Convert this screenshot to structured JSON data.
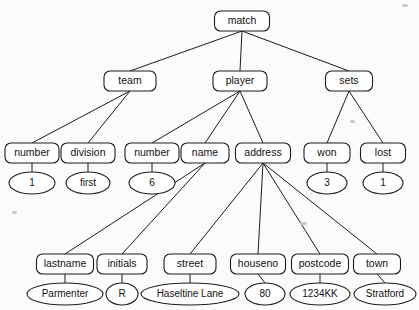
{
  "diagram": {
    "type": "tree",
    "background_color": "#fbfbfa",
    "line_color": "#1c1c1c",
    "node_fill": "#ffffff",
    "element_nodes": [
      {
        "id": "match",
        "label": "match",
        "x": 242,
        "y": 21,
        "w": 55,
        "h": 20,
        "level": 0
      },
      {
        "id": "team",
        "label": "team",
        "x": 130,
        "y": 81,
        "w": 52,
        "h": 20,
        "level": 1
      },
      {
        "id": "player",
        "label": "player",
        "x": 240,
        "y": 81,
        "w": 54,
        "h": 20,
        "level": 1
      },
      {
        "id": "sets",
        "label": "sets",
        "x": 349,
        "y": 81,
        "w": 47,
        "h": 20,
        "level": 1
      },
      {
        "id": "t_number",
        "label": "number",
        "x": 32,
        "y": 153,
        "w": 54,
        "h": 20,
        "level": 2
      },
      {
        "id": "division",
        "label": "division",
        "x": 88,
        "y": 153,
        "w": 54,
        "h": 20,
        "level": 2
      },
      {
        "id": "p_number",
        "label": "number",
        "x": 152,
        "y": 153,
        "w": 54,
        "h": 20,
        "level": 2
      },
      {
        "id": "name",
        "label": "name",
        "x": 205,
        "y": 153,
        "w": 48,
        "h": 20,
        "level": 2
      },
      {
        "id": "address",
        "label": "address",
        "x": 263,
        "y": 153,
        "w": 55,
        "h": 20,
        "level": 2
      },
      {
        "id": "won",
        "label": "won",
        "x": 327,
        "y": 153,
        "w": 46,
        "h": 20,
        "level": 2
      },
      {
        "id": "lost",
        "label": "lost",
        "x": 383,
        "y": 153,
        "w": 45,
        "h": 20,
        "level": 2
      },
      {
        "id": "lastname",
        "label": "lastname",
        "x": 65,
        "y": 264,
        "w": 57,
        "h": 20,
        "level": 3
      },
      {
        "id": "initials",
        "label": "initials",
        "x": 122,
        "y": 264,
        "w": 50,
        "h": 20,
        "level": 3
      },
      {
        "id": "street",
        "label": "street",
        "x": 190,
        "y": 264,
        "w": 52,
        "h": 20,
        "level": 3
      },
      {
        "id": "houseno",
        "label": "houseno",
        "x": 258,
        "y": 264,
        "w": 55,
        "h": 20,
        "level": 3
      },
      {
        "id": "postcode",
        "label": "postcode",
        "x": 320,
        "y": 264,
        "w": 57,
        "h": 20,
        "level": 3
      },
      {
        "id": "town",
        "label": "town",
        "x": 377,
        "y": 264,
        "w": 47,
        "h": 20,
        "level": 3
      }
    ],
    "value_nodes": [
      {
        "id": "v_team_number",
        "label": "1",
        "x": 32,
        "y": 183,
        "rx": 23,
        "ry": 11,
        "parent": "t_number"
      },
      {
        "id": "v_division",
        "label": "first",
        "x": 88,
        "y": 183,
        "rx": 22,
        "ry": 11,
        "parent": "division"
      },
      {
        "id": "v_p_number",
        "label": "6",
        "x": 152,
        "y": 183,
        "rx": 23,
        "ry": 11,
        "parent": "p_number"
      },
      {
        "id": "v_won",
        "label": "3",
        "x": 327,
        "y": 183,
        "rx": 20,
        "ry": 11,
        "parent": "won"
      },
      {
        "id": "v_lost",
        "label": "1",
        "x": 383,
        "y": 183,
        "rx": 20,
        "ry": 11,
        "parent": "lost"
      },
      {
        "id": "v_lastname",
        "label": "Parmenter",
        "x": 65,
        "y": 294,
        "rx": 38,
        "ry": 11,
        "parent": "lastname"
      },
      {
        "id": "v_initials",
        "label": "R",
        "x": 122,
        "y": 294,
        "rx": 16,
        "ry": 11,
        "parent": "initials"
      },
      {
        "id": "v_street",
        "label": "Haseltine Lane",
        "x": 190,
        "y": 294,
        "rx": 49,
        "ry": 11,
        "parent": "street"
      },
      {
        "id": "v_houseno",
        "label": "80",
        "x": 265,
        "y": 294,
        "rx": 20,
        "ry": 11,
        "parent": "houseno"
      },
      {
        "id": "v_postcode",
        "label": "1234KK",
        "x": 320,
        "y": 294,
        "rx": 30,
        "ry": 11,
        "parent": "postcode"
      },
      {
        "id": "v_town",
        "label": "Stratford",
        "x": 385,
        "y": 294,
        "rx": 31,
        "ry": 11,
        "parent": "town"
      }
    ],
    "edges": [
      {
        "from": "match",
        "to": "team"
      },
      {
        "from": "match",
        "to": "player"
      },
      {
        "from": "match",
        "to": "sets"
      },
      {
        "from": "team",
        "to": "t_number"
      },
      {
        "from": "team",
        "to": "division"
      },
      {
        "from": "player",
        "to": "p_number"
      },
      {
        "from": "player",
        "to": "name"
      },
      {
        "from": "player",
        "to": "address"
      },
      {
        "from": "sets",
        "to": "won"
      },
      {
        "from": "sets",
        "to": "lost"
      },
      {
        "from": "name",
        "to": "lastname"
      },
      {
        "from": "name",
        "to": "initials"
      },
      {
        "from": "address",
        "to": "street"
      },
      {
        "from": "address",
        "to": "houseno"
      },
      {
        "from": "address",
        "to": "postcode"
      },
      {
        "from": "address",
        "to": "town"
      }
    ],
    "specks": [
      {
        "x": 402,
        "y": 4,
        "w": 6,
        "h": 3
      },
      {
        "x": 12,
        "y": 211,
        "w": 5,
        "h": 3
      },
      {
        "x": 300,
        "y": 222,
        "w": 7,
        "h": 3
      },
      {
        "x": 350,
        "y": 120,
        "w": 5,
        "h": 3
      }
    ]
  }
}
